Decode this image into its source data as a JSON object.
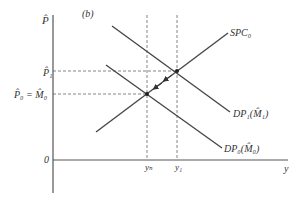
{
  "panel_label": "(b)",
  "axes": {
    "y_label": "P̂",
    "x_label": "y",
    "origin_label": "0"
  },
  "y_ticks": {
    "p1": "P̂₁",
    "p0": "P̂₀ = M̂₀"
  },
  "x_ticks": {
    "yn": "yₙ",
    "y1": "y₁"
  },
  "curves": {
    "spc": "SPC₀",
    "dp1": "DP₁(M̂₁)",
    "dp0": "DP₀(M̂₀)"
  },
  "points": [
    {
      "name": "equilibrium-0",
      "x_label": "yₙ",
      "y_label": "P̂₀ = M̂₀"
    },
    {
      "name": "equilibrium-1",
      "x_label": "y₁",
      "y_label": "P̂₁"
    }
  ],
  "adjustment_path": "arrows along SPC₀ from equilibrium-1 back toward equilibrium-0"
}
